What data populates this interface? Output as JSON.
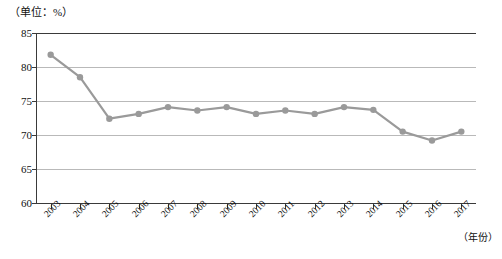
{
  "chart_data": {
    "type": "line",
    "title": "",
    "subtitle": "",
    "unit_label": "（单位：%）",
    "xlabel": "（年份）",
    "ylabel": "",
    "grid": true,
    "legend": false,
    "legend_position": "none",
    "ylim": [
      60,
      85
    ],
    "yticks": [
      60,
      65,
      70,
      75,
      80,
      85
    ],
    "ytick_labels": [
      "60",
      "65",
      "70",
      "75",
      "80",
      "85"
    ],
    "categories": [
      "2003",
      "2004",
      "2005",
      "2006",
      "2007",
      "2008",
      "2009",
      "2010",
      "2011",
      "2012",
      "2013",
      "2014",
      "2015",
      "2016",
      "2017"
    ],
    "series": [
      {
        "name": "",
        "color": "#9a9a9a",
        "marker": "circle",
        "values": [
          81.8,
          78.5,
          72.4,
          73.1,
          74.1,
          73.6,
          74.1,
          73.1,
          73.6,
          73.1,
          74.1,
          73.7,
          70.5,
          69.2,
          70.5
        ]
      }
    ]
  },
  "axis": {
    "unit_label": "（单位：%）",
    "x_title": "（年份）"
  },
  "colors": {
    "series": "#9a9a9a",
    "grid": "#b9b9b9",
    "axis": "#3a3a3a",
    "text": "#111111",
    "background": "#ffffff"
  }
}
